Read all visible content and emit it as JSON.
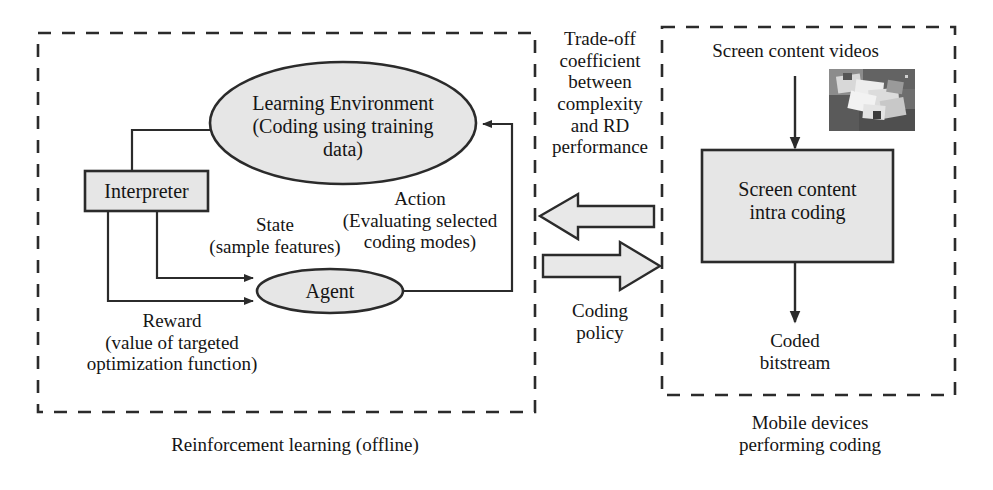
{
  "figure": {
    "type": "block-diagram"
  },
  "left_panel": {
    "caption": "Reinforcement learning (offline)",
    "nodes": {
      "learning_environment": "Learning Environment\n(Coding using training\ndata)",
      "interpreter": "Interpreter",
      "agent": "Agent"
    },
    "edge_labels": {
      "state": "State\n(sample features)",
      "reward": "Reward\n(value of targeted\noptimization function)",
      "action": "Action\n(Evaluating selected\ncoding modes)"
    }
  },
  "middle": {
    "arrow_left_label": "Trade-off\ncoefficient\nbetween\ncomplexity\nand RD\nperformance",
    "arrow_right_label": "Coding\npolicy",
    "arrow_left_direction": "left",
    "arrow_right_direction": "right"
  },
  "right_panel": {
    "caption": "Mobile devices\nperforming coding",
    "input_label": "Screen content videos",
    "process_box": "Screen content\nintra coding",
    "output_label": "Coded\nbitstream",
    "thumbnail_alt": "screen-content-sample-frame"
  },
  "colors": {
    "node_fill": "#e6e6e6",
    "stroke": "#2b2b2b",
    "text": "#151515",
    "background": "#ffffff",
    "thumbnail_base": "#6e6e6e"
  }
}
